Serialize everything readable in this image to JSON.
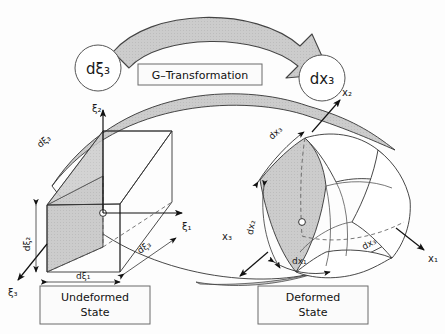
{
  "figure": {
    "background_color": "#fdfdfd",
    "ink_color": "#1a1a1a",
    "shade_color": "#c9c9c9",
    "shade_color_light": "#d7d7d7"
  },
  "transformation": {
    "source_bubble": "dξ₃",
    "target_bubble": "dx₃",
    "arrow_label": "G–Transformation",
    "arrow_direction": "left-to-right-curved"
  },
  "undeformed": {
    "caption_line1": "Undeformed",
    "caption_line2": "State",
    "axes": [
      {
        "name": "axis-xi1",
        "label": "ξ₁",
        "direction": "right"
      },
      {
        "name": "axis-xi2",
        "label": "ξ₂",
        "direction": "up"
      },
      {
        "name": "axis-xi3",
        "label": "ξ₃",
        "direction": "lower-left"
      }
    ],
    "edge_labels": [
      {
        "name": "d-xi-1",
        "label": "dξ₁"
      },
      {
        "name": "d-xi-2",
        "label": "dξ₂"
      },
      {
        "name": "d-xi-3-top",
        "label": "dξ₃"
      },
      {
        "name": "d-xi-3-bottom",
        "label": "dξ₃"
      }
    ],
    "element_type": "rectangular-cuboid"
  },
  "deformed": {
    "caption_line1": "Deformed",
    "caption_line2": "State",
    "axes": [
      {
        "name": "axis-x1",
        "label": "x₁",
        "direction": "lower-right"
      },
      {
        "name": "axis-x2",
        "label": "x₂",
        "direction": "upper-right"
      },
      {
        "name": "axis-x3",
        "label": "x₃",
        "direction": "lower-left"
      }
    ],
    "edge_labels": [
      {
        "name": "d-x-1",
        "label": "dx₁"
      },
      {
        "name": "d-x-2",
        "label": "dx₂"
      },
      {
        "name": "d-x-3-top",
        "label": "dx₃"
      },
      {
        "name": "d-x-3-right",
        "label": "dx₃"
      }
    ],
    "element_type": "curvilinear-hexahedron"
  }
}
